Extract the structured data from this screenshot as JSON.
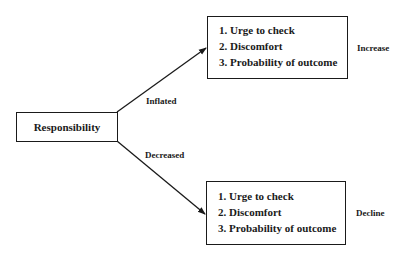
{
  "diagram": {
    "source_node": {
      "label": "Responsibility"
    },
    "edges": [
      {
        "label": "Inflated",
        "target": "top"
      },
      {
        "label": "Decreased",
        "target": "bottom"
      }
    ],
    "top_box": {
      "items": [
        "1. Urge to check",
        "2. Discomfort",
        "3. Probability of outcome"
      ],
      "side_label": "Increase"
    },
    "bottom_box": {
      "items": [
        "1. Urge to check",
        "2. Discomfort",
        "3. Probability of outcome"
      ],
      "side_label": "Decline"
    }
  },
  "colors": {
    "line": "#1a1a1a",
    "background": "#ffffff"
  }
}
